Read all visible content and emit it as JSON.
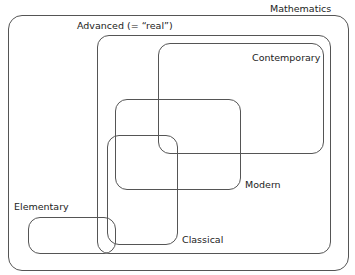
{
  "diagram": {
    "type": "euler-diagram",
    "sets": [
      {
        "id": "mathematics",
        "label": "Mathematics"
      },
      {
        "id": "advanced",
        "label": "Advanced (= “real”)"
      },
      {
        "id": "contemporary",
        "label": "Contemporary"
      },
      {
        "id": "modern",
        "label": "Modern"
      },
      {
        "id": "classical",
        "label": "Classical"
      },
      {
        "id": "elementary",
        "label": "Elementary"
      }
    ],
    "line_color": "#555555",
    "text_color": "#222222"
  }
}
